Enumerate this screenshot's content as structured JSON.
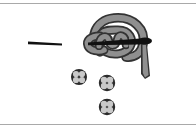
{
  "figure": {
    "background_color": "#ffffff",
    "rule_color": "#a9a9a9",
    "ink_dark": "#1a1a1a",
    "ink_mid": "#4a4a4a",
    "ink_gray": "#8f8f8f",
    "ink_gray_light": "#a8a8a8",
    "width": 196,
    "height": 129
  },
  "rules": [
    {
      "name": "top-rule",
      "y": 3
    },
    {
      "name": "bottom-rule",
      "y": 124
    }
  ],
  "elements": [
    {
      "name": "dash-mark",
      "label": "Dash stroke",
      "x": 28,
      "y": 42,
      "width": 35,
      "height": 3,
      "color": "#111111"
    },
    {
      "name": "thread-loop",
      "label": "Looped thread arc",
      "x": 92,
      "y": 16,
      "width": 52,
      "height": 40,
      "color": "#8f8f8f",
      "outline": "#333333"
    },
    {
      "name": "interlocking-knot",
      "label": "Interlocking zigzag knot",
      "x": 97,
      "y": 31,
      "width": 30,
      "height": 17,
      "color": "#8f8f8f",
      "outline": "#333333"
    },
    {
      "name": "needle",
      "label": "Sewing needle",
      "x": 88,
      "y": 36,
      "width": 68,
      "height": 44,
      "color": "#111111"
    },
    {
      "name": "button-1",
      "label": "Four-lobed button (left)",
      "cx": 79,
      "cy": 77,
      "r": 8,
      "color": "#2b2b2b"
    },
    {
      "name": "button-2",
      "label": "Four-lobed button (middle)",
      "cx": 107,
      "cy": 83,
      "r": 8,
      "color": "#2b2b2b"
    },
    {
      "name": "button-3",
      "label": "Four-lobed button (bottom)",
      "cx": 107,
      "cy": 107,
      "r": 8,
      "color": "#2b2b2b"
    }
  ]
}
